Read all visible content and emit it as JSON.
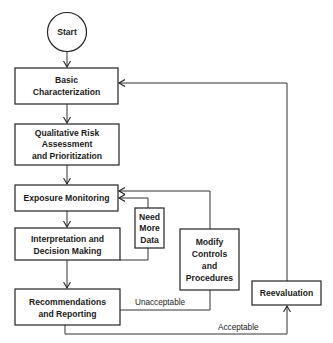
{
  "diagram": {
    "type": "flowchart",
    "nodes": {
      "start": {
        "label": "Start",
        "shape": "circle"
      },
      "basic": {
        "lines": [
          "Basic",
          "Characterization"
        ]
      },
      "qualitative": {
        "lines": [
          "Qualitative Risk",
          "Assessment",
          "and Prioritization"
        ]
      },
      "exposure": {
        "lines": [
          "Exposure Monitoring"
        ]
      },
      "needmore": {
        "lines": [
          "Need",
          "More",
          "Data"
        ]
      },
      "interpretation": {
        "lines": [
          "Interpretation and",
          "Decision Making"
        ]
      },
      "modify": {
        "lines": [
          "Modify",
          "Controls",
          "and",
          "Procedures"
        ]
      },
      "recommendations": {
        "lines": [
          "Recommendations",
          "and Reporting"
        ]
      },
      "reevaluation": {
        "lines": [
          "Reevaluation"
        ]
      }
    },
    "edges": [
      {
        "from": "start",
        "to": "basic",
        "label": ""
      },
      {
        "from": "basic",
        "to": "qualitative",
        "label": ""
      },
      {
        "from": "qualitative",
        "to": "exposure",
        "label": ""
      },
      {
        "from": "exposure",
        "to": "interpretation",
        "label": ""
      },
      {
        "from": "interpretation",
        "to": "needmore",
        "label": ""
      },
      {
        "from": "needmore",
        "to": "exposure",
        "label": ""
      },
      {
        "from": "interpretation",
        "to": "recommendations",
        "label": ""
      },
      {
        "from": "recommendations",
        "to": "modify",
        "label": "Unacceptable"
      },
      {
        "from": "modify",
        "to": "exposure",
        "label": ""
      },
      {
        "from": "recommendations",
        "to": "reevaluation",
        "label": "Acceptable"
      },
      {
        "from": "reevaluation",
        "to": "basic",
        "label": ""
      }
    ],
    "edge_labels": {
      "unacceptable": "Unacceptable",
      "acceptable": "Acceptable"
    }
  }
}
